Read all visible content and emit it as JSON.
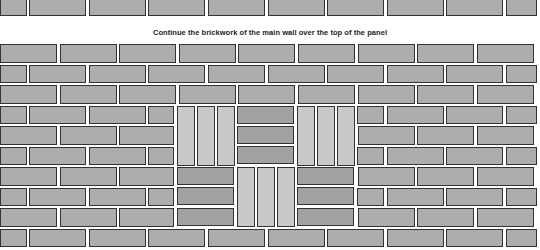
{
  "caption": "Continue the brickwork of the main wall over the top of the panel",
  "colors": {
    "wall_brick": "#adadad",
    "panel_horizontal_brick": "#a2a2a2",
    "panel_vertical_brick": "#c9c9c9",
    "mortar_outline": "#333333",
    "background": "#ffffff"
  },
  "layout": {
    "brick_pitch_x": 59.6,
    "brick_width": 57,
    "brick_height": 18.5,
    "top_row": {
      "y": -2,
      "height": 18,
      "offset": -30.5
    },
    "main_rows_start_y": 44,
    "main_row_pitch": 20.5,
    "main_row_count": 10,
    "row_offsets": [
      0,
      -30.5
    ],
    "right_edge": 537,
    "panel": {
      "x": 177,
      "y": 106,
      "cell": 57,
      "cell_pitch": 60,
      "sub_pitch": 20.2,
      "sub_size": 17.5,
      "cells": [
        {
          "col": 0,
          "row": 0,
          "type": "vertical"
        },
        {
          "col": 1,
          "row": 0,
          "type": "horizontal"
        },
        {
          "col": 2,
          "row": 0,
          "type": "vertical"
        },
        {
          "col": 0,
          "row": 1,
          "type": "horizontal"
        },
        {
          "col": 1,
          "row": 1,
          "type": "vertical"
        },
        {
          "col": 2,
          "row": 1,
          "type": "horizontal"
        }
      ],
      "rows_covered": [
        3,
        8
      ]
    }
  }
}
